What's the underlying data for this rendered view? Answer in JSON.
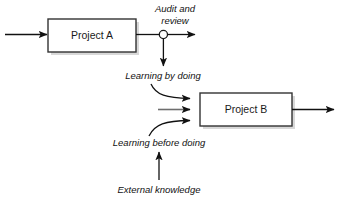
{
  "diagram": {
    "background_color": "#ffffff",
    "line_color": "#111111",
    "box_stroke_color": "#333333",
    "box_fill_color": "#ffffff",
    "shadow_color": "#b8b8b8",
    "nodes": [
      {
        "id": "project-a",
        "label": "Project A"
      },
      {
        "id": "project-b",
        "label": "Project B"
      }
    ],
    "junction": {
      "id": "audit-junction",
      "shape": "circle"
    },
    "flow_labels": [
      {
        "id": "audit-and-review",
        "line1": "Audit and",
        "line2": "review"
      },
      {
        "id": "learning-by-doing",
        "text": "Learning by doing"
      },
      {
        "id": "learning-before-doing",
        "text": "Learning before doing"
      },
      {
        "id": "external-knowledge",
        "text": "External knowledge"
      }
    ]
  }
}
